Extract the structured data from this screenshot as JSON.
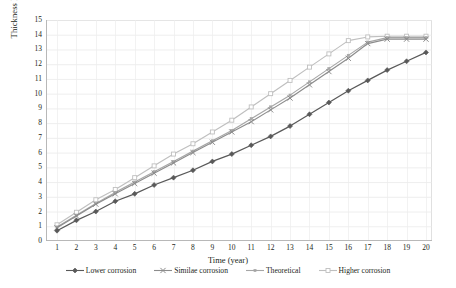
{
  "chart_data": {
    "type": "line",
    "title": "",
    "xlabel": "Time (year)",
    "ylabel": "Thickness loss (mm)",
    "xlim": [
      1,
      20
    ],
    "ylim": [
      0,
      15
    ],
    "grid": true,
    "legend_position": "bottom",
    "x": [
      1,
      2,
      3,
      4,
      5,
      6,
      7,
      8,
      9,
      10,
      11,
      12,
      13,
      14,
      15,
      16,
      17,
      18,
      19,
      20
    ],
    "xticks": [
      "1",
      "2",
      "3",
      "4",
      "5",
      "6",
      "7",
      "8",
      "9",
      "10",
      "11",
      "12",
      "13",
      "14",
      "15",
      "16",
      "17",
      "18",
      "19",
      "20"
    ],
    "yticks": [
      "0",
      "1",
      "2",
      "3",
      "4",
      "5",
      "6",
      "7",
      "8",
      "9",
      "10",
      "11",
      "12",
      "13",
      "14",
      "15"
    ],
    "series": [
      {
        "name": "Lower corrosion",
        "color": "#595959",
        "marker": "diamond",
        "values": [
          0.7,
          1.4,
          2.0,
          2.7,
          3.2,
          3.8,
          4.3,
          4.8,
          5.4,
          5.9,
          6.5,
          7.1,
          7.8,
          8.6,
          9.4,
          10.2,
          10.9,
          11.6,
          12.2,
          12.8
        ]
      },
      {
        "name": "Similae corrosion",
        "color": "#8c8c8c",
        "marker": "x",
        "values": [
          0.9,
          1.7,
          2.5,
          3.2,
          3.9,
          4.6,
          5.3,
          6.0,
          6.7,
          7.4,
          8.1,
          8.9,
          9.7,
          10.6,
          11.5,
          12.4,
          13.4,
          13.7,
          13.7,
          13.7
        ]
      },
      {
        "name": "Theoretical",
        "color": "#a6a6a6",
        "marker": "smallsquare",
        "values": [
          0.95,
          1.75,
          2.55,
          3.3,
          4.0,
          4.7,
          5.4,
          6.1,
          6.8,
          7.5,
          8.3,
          9.1,
          9.9,
          10.8,
          11.7,
          12.6,
          13.5,
          13.8,
          13.8,
          13.8
        ]
      },
      {
        "name": "Higher corrosion",
        "color": "#bfbfbf",
        "marker": "opensquare",
        "values": [
          1.1,
          1.95,
          2.8,
          3.5,
          4.3,
          5.1,
          5.9,
          6.6,
          7.4,
          8.2,
          9.1,
          10.0,
          10.9,
          11.8,
          12.7,
          13.6,
          13.85,
          13.9,
          13.9,
          13.9
        ]
      }
    ]
  },
  "axes": {
    "xlabel": "Time (year)",
    "ylabel": "Thickness loss (mm)"
  },
  "legend": {
    "items": [
      {
        "label": "Lower corrosion"
      },
      {
        "label": "Similae corrosion"
      },
      {
        "label": "Theoretical"
      },
      {
        "label": "Higher corrosion"
      }
    ]
  }
}
